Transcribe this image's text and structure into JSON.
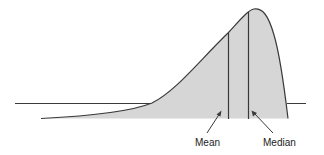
{
  "diagram": {
    "type": "skewed-distribution",
    "colors": {
      "fill": "#d6d6d6",
      "stroke": "#3a3a3a",
      "background": "#ffffff"
    },
    "labels": {
      "mean": "Mean",
      "median": "Median"
    }
  }
}
